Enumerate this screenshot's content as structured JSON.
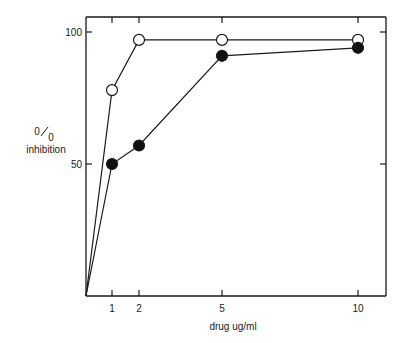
{
  "chart_data": {
    "type": "line",
    "title": "",
    "xlabel": "drug ug/ml",
    "ylabel_line1": "0/0",
    "ylabel_sup": "0",
    "ylabel_sub": "0",
    "ylabel_line2": "inhibition",
    "xlim": [
      0,
      11
    ],
    "ylim": [
      0,
      100
    ],
    "x_ticks": [
      1,
      2,
      5,
      10
    ],
    "y_ticks": [
      50,
      100
    ],
    "grid": false,
    "legend": null,
    "series": [
      {
        "name": "open circles",
        "marker": "open-circle",
        "x": [
          0,
          1,
          2,
          5,
          10
        ],
        "y": [
          0,
          78,
          97,
          97,
          97
        ]
      },
      {
        "name": "filled circles",
        "marker": "filled-circle",
        "x": [
          0,
          1,
          2,
          5,
          10
        ],
        "y": [
          0,
          50,
          57,
          91,
          94
        ]
      }
    ]
  },
  "labels": {
    "xlabel": "drug ug/ml",
    "ylabel_sup": "0",
    "ylabel_sub": "0",
    "ylabel_line2": "inhibition",
    "xtick_1": "1",
    "xtick_2": "2",
    "xtick_5": "5",
    "xtick_10": "10",
    "ytick_50": "50",
    "ytick_100": "100"
  }
}
